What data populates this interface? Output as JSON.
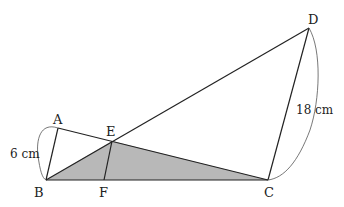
{
  "diagram": {
    "type": "geometry",
    "points": {
      "A": {
        "label": "A",
        "x": 58,
        "y": 128
      },
      "B": {
        "label": "B",
        "x": 46,
        "y": 180
      },
      "C": {
        "label": "C",
        "x": 268,
        "y": 180
      },
      "D": {
        "label": "D",
        "x": 309,
        "y": 28
      },
      "E": {
        "label": "E",
        "x": 112,
        "y": 141
      },
      "F": {
        "label": "F",
        "x": 104,
        "y": 180
      }
    },
    "segments": [
      "AB",
      "AC",
      "BD",
      "CD",
      "BC",
      "EF"
    ],
    "shaded_region": [
      "B",
      "E",
      "C"
    ],
    "shade_color": "#b8b8b8",
    "line_color": "#222222",
    "measurements": {
      "AB": "6 cm",
      "CD": "18 cm"
    }
  }
}
